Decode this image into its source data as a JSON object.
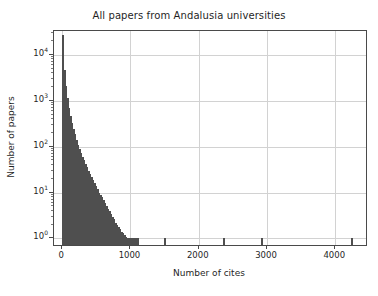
{
  "figure": {
    "width": 378,
    "height": 296,
    "background_color": "#ffffff",
    "bar_color": "#4f4f4f",
    "grid_color": "#d2d2d2",
    "spine_color": "#4a4a4a",
    "text_color": "#1f1f1f"
  },
  "chart_data": {
    "type": "bar",
    "title": "All papers from Andalusia universities",
    "xlabel": "Number of cites",
    "ylabel": "Number of papers",
    "grid": true,
    "legend": null,
    "yscale": "log",
    "xscale": "linear",
    "xlim": [
      -120,
      4450
    ],
    "ylim": [
      0.72,
      33000
    ],
    "xticks": [
      0,
      1000,
      2000,
      3000,
      4000
    ],
    "xtick_labels": [
      "0",
      "1000",
      "2000",
      "3000",
      "4000"
    ],
    "yticks": [
      1,
      10,
      100,
      1000,
      10000
    ],
    "ytick_labels": [
      "10⁰",
      "10¹",
      "10²",
      "10³",
      "10⁴"
    ],
    "ytick_bases": [
      "10",
      "10",
      "10",
      "10",
      "10"
    ],
    "ytick_exponents": [
      "0",
      "1",
      "2",
      "3",
      "4"
    ],
    "bin_width": 22,
    "x": [
      0,
      22,
      44,
      66,
      88,
      110,
      132,
      154,
      176,
      198,
      220,
      242,
      264,
      286,
      308,
      330,
      352,
      374,
      396,
      418,
      440,
      462,
      484,
      506,
      528,
      550,
      572,
      594,
      616,
      638,
      660,
      682,
      704,
      726,
      748,
      770,
      792,
      814,
      836,
      858,
      880,
      902,
      924,
      946,
      968,
      990,
      1012,
      1034,
      1056,
      1078,
      1100,
      1496,
      2354,
      2904,
      4224
    ],
    "values": [
      27000,
      4700,
      2100,
      1150,
      700,
      470,
      330,
      245,
      185,
      140,
      110,
      88,
      72,
      60,
      50,
      42,
      36,
      30,
      26,
      22,
      19,
      16,
      14,
      12,
      10,
      9,
      8,
      7,
      6,
      5,
      4.5,
      4,
      3.5,
      3,
      2.6,
      2.2,
      2,
      1.8,
      1.6,
      1.4,
      1.3,
      1.2,
      1.1,
      1,
      1,
      1,
      1,
      1,
      1,
      1,
      1,
      1,
      1,
      1,
      1
    ],
    "series": [
      {
        "name": "papers",
        "values": [
          27000,
          4700,
          2100,
          1150,
          700,
          470,
          330,
          245,
          185,
          140,
          110,
          88,
          72,
          60,
          50,
          42,
          36,
          30,
          26,
          22,
          19,
          16,
          14,
          12,
          10,
          9,
          8,
          7,
          6,
          5,
          4.5,
          4,
          3.5,
          3,
          2.6,
          2.2,
          2,
          1.8,
          1.6,
          1.4,
          1.3,
          1.2,
          1.1,
          1,
          1,
          1,
          1,
          1,
          1,
          1,
          1,
          1,
          1,
          1,
          1
        ]
      }
    ]
  }
}
